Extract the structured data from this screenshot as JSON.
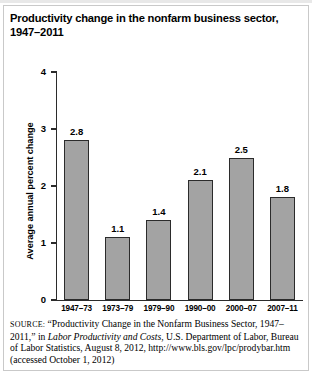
{
  "figure": {
    "title_line1": "Productivity change in the nonfarm business sector,",
    "title_line2": "1947–2011"
  },
  "axes": {
    "y_title": "Average annual percent change",
    "y_ticks": [
      "0",
      "1",
      "2",
      "3",
      "4"
    ]
  },
  "source": {
    "label": "SOURCE:",
    "text_part1": " “Productivity Change in the Nonfarm Business Sector, 1947–2011,” in ",
    "italic_title": "Labor Productivity and Costs",
    "text_part2": ", U.S. Department of Labor, Bureau of Labor Statistics, August 8, 2012, http://www.bls.gov/lpc/prodybar.htm (accessed October 1, 2012)"
  },
  "chart_data": {
    "type": "bar",
    "title": "Productivity change in the nonfarm business sector, 1947–2011",
    "xlabel": "",
    "ylabel": "Average annual percent change",
    "ylim": [
      0,
      4
    ],
    "yticks": [
      0,
      1,
      2,
      3,
      4
    ],
    "grid": false,
    "legend": "none",
    "bar_color": "#a3a3a3",
    "bar_edge_color": "#2b2b2b",
    "categories": [
      "1947–73",
      "1973–79",
      "1979–90",
      "1990–00",
      "2000–07",
      "2007–11"
    ],
    "values": [
      2.8,
      1.1,
      1.4,
      2.1,
      2.5,
      1.8
    ],
    "value_labels": [
      "2.8",
      "1.1",
      "1.4",
      "2.1",
      "2.5",
      "1.8"
    ]
  }
}
